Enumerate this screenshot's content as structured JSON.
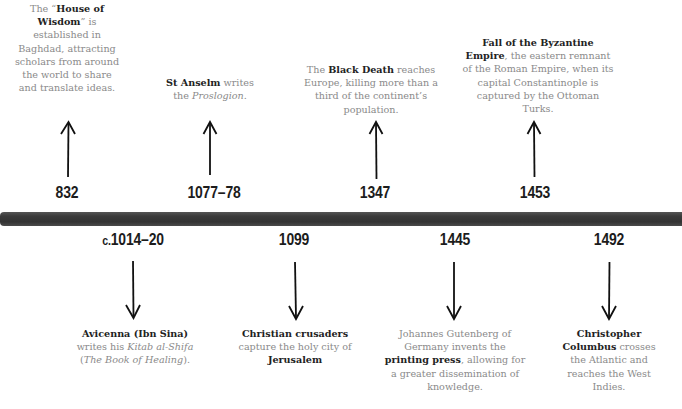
{
  "timeline": {
    "colors": {
      "bar": "#3b3b3b",
      "date_text": "#1c1c1c",
      "body_text": "#8a8a8a",
      "bold_text": "#222222"
    },
    "above": [
      {
        "date": "832",
        "parts": [
          {
            "t": "The “",
            "s": "n"
          },
          {
            "t": "House of Wisdom",
            "s": "b"
          },
          {
            "t": "” is established in Baghdad, attracting scholars from around the world to share and translate ideas.",
            "s": "n"
          }
        ]
      },
      {
        "date": "1077–78",
        "parts": [
          {
            "t": "St Anselm",
            "s": "b"
          },
          {
            "t": " writes the ",
            "s": "n"
          },
          {
            "t": "Proslogion",
            "s": "i"
          },
          {
            "t": ".",
            "s": "n"
          }
        ]
      },
      {
        "date": "1347",
        "parts": [
          {
            "t": "The ",
            "s": "n"
          },
          {
            "t": "Black Death",
            "s": "b"
          },
          {
            "t": " reaches Europe, killing more than a third of the continent’s population.",
            "s": "n"
          }
        ]
      },
      {
        "date": "1453",
        "parts": [
          {
            "t": "Fall of the Byzantine Empire",
            "s": "b"
          },
          {
            "t": ", the eastern remnant of the Roman Empire, when its capital Constantinople is captured by the Ottoman Turks.",
            "s": "n"
          }
        ]
      }
    ],
    "below": [
      {
        "date_prefix": "c.",
        "date": "1014–20",
        "parts": [
          {
            "t": "Avicenna (Ibn Sina)",
            "s": "b"
          },
          {
            "t": " writes his ",
            "s": "n"
          },
          {
            "t": "Kitab al-Shifa",
            "s": "i"
          },
          {
            "t": " (",
            "s": "n"
          },
          {
            "t": "The Book of Healing",
            "s": "i"
          },
          {
            "t": ").",
            "s": "n"
          }
        ]
      },
      {
        "date_prefix": "",
        "date": "1099",
        "parts": [
          {
            "t": "Christian crusaders",
            "s": "b"
          },
          {
            "t": " capture the holy city of ",
            "s": "n"
          },
          {
            "t": "Jerusalem",
            "s": "b"
          }
        ]
      },
      {
        "date_prefix": "",
        "date": "1445",
        "parts": [
          {
            "t": "Johannes Gutenberg of Germany invents the ",
            "s": "n"
          },
          {
            "t": "printing press",
            "s": "b"
          },
          {
            "t": ", allowing for a greater dissemination of knowledge.",
            "s": "n"
          }
        ]
      },
      {
        "date_prefix": "",
        "date": "1492",
        "parts": [
          {
            "t": "Christopher Columbus",
            "s": "b"
          },
          {
            "t": " crosses the Atlantic and reaches the West Indies.",
            "s": "n"
          }
        ]
      }
    ]
  }
}
